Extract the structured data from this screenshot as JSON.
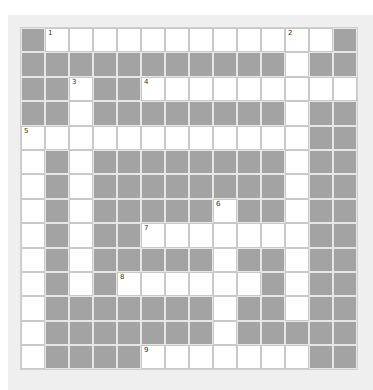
{
  "puzzle": {
    "type": "crossword",
    "rows": 14,
    "cols": 14,
    "colors": {
      "page_bg": "#ffffff",
      "panel_bg": "#efefef",
      "block": "#a3a3a3",
      "open": "#ffffff"
    },
    "layout": [
      "#............#",
      "###########.##",
      "##.##.........",
      "##.########.##",
      "............##",
      ".#.########.##",
      ".#.########.##",
      ".#.#####.##.##",
      ".#.##.......##",
      ".#.#####.##.##",
      ".#.#......#.##",
      ".#######.##.##",
      ".#######.#####",
      ".####.......##"
    ],
    "numbers": [
      {
        "n": "1",
        "row": 0,
        "col": 1
      },
      {
        "n": "2",
        "row": 0,
        "col": 11
      },
      {
        "n": "3",
        "row": 2,
        "col": 2
      },
      {
        "n": "4",
        "row": 2,
        "col": 5
      },
      {
        "n": "5",
        "row": 4,
        "col": 0
      },
      {
        "n": "6",
        "row": 7,
        "col": 8
      },
      {
        "n": "7",
        "row": 8,
        "col": 5
      },
      {
        "n": "8",
        "row": 10,
        "col": 4
      },
      {
        "n": "9",
        "row": 13,
        "col": 5
      }
    ]
  }
}
